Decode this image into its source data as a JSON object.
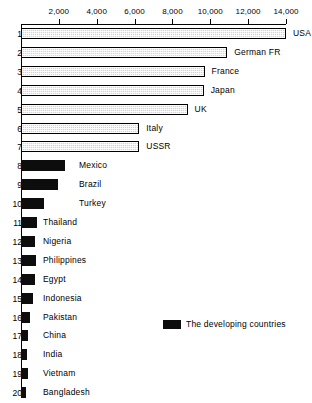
{
  "chart_data": {
    "type": "bar",
    "orientation": "horizontal",
    "title": "",
    "xlabel": "",
    "ylabel": "",
    "xlim": [
      0,
      14000
    ],
    "grid": false,
    "tick_labels": [
      "2,000",
      "4,000",
      "6,000",
      "8,000",
      "10,000",
      "12,000",
      "14,000"
    ],
    "tick_values": [
      2000,
      4000,
      6000,
      8000,
      10000,
      12000,
      14000
    ],
    "categories": [
      "USA",
      "German FR",
      "France",
      "Japan",
      "UK",
      "Italy",
      "USSR",
      "Mexico",
      "Brazil",
      "Turkey",
      "Thailand",
      "Nigeria",
      "Philippines",
      "Egypt",
      "Indonesia",
      "Pakistan",
      "China",
      "India",
      "Vietnam",
      "Bangladesh"
    ],
    "rank_numbers": [
      "1",
      "2",
      "3",
      "4",
      "5",
      "6",
      "7",
      "8",
      "9",
      "10",
      "11",
      "12",
      "13",
      "14",
      "15",
      "16",
      "17",
      "18",
      "19",
      "20"
    ],
    "values": [
      14000,
      10900,
      9700,
      9650,
      8800,
      6250,
      6250,
      2350,
      1950,
      1200,
      820,
      760,
      790,
      740,
      640,
      460,
      360,
      330,
      380,
      260
    ],
    "series": [
      {
        "name": "The developed countries",
        "style": "hatched",
        "color": "#d4d4d4",
        "members": [
          "USA",
          "German FR",
          "France",
          "Japan",
          "UK",
          "Italy",
          "USSR"
        ]
      },
      {
        "name": "The developing countries",
        "style": "solid",
        "color": "#0d0d0d",
        "members": [
          "Mexico",
          "Brazil",
          "Turkey",
          "Thailand",
          "Nigeria",
          "Philippines",
          "Egypt",
          "Indonesia",
          "Pakistan",
          "China",
          "India",
          "Vietnam",
          "Bangladesh"
        ]
      }
    ],
    "legend": {
      "position": "middle-right",
      "entries": [
        {
          "label": "The developing countries",
          "color": "#0d0d0d"
        }
      ]
    }
  },
  "rows": [
    {
      "num": "1",
      "label": "USA",
      "value": 14000,
      "type": "developed"
    },
    {
      "num": "2",
      "label": "German FR",
      "value": 10900,
      "type": "developed"
    },
    {
      "num": "3",
      "label": "France",
      "value": 9700,
      "type": "developed"
    },
    {
      "num": "4",
      "label": "Japan",
      "value": 9650,
      "type": "developed"
    },
    {
      "num": "5",
      "label": "UK",
      "value": 8800,
      "type": "developed"
    },
    {
      "num": "6",
      "label": "Italy",
      "value": 6250,
      "type": "developed"
    },
    {
      "num": "7",
      "label": "USSR",
      "value": 6250,
      "type": "developed"
    },
    {
      "num": "8",
      "label": "Mexico",
      "value": 2350,
      "type": "developing"
    },
    {
      "num": "9",
      "label": "Brazil",
      "value": 1950,
      "type": "developing"
    },
    {
      "num": "10",
      "label": "Turkey",
      "value": 1200,
      "type": "developing"
    },
    {
      "num": "11",
      "label": "Thailand",
      "value": 820,
      "type": "developing"
    },
    {
      "num": "12",
      "label": "Nigeria",
      "value": 760,
      "type": "developing"
    },
    {
      "num": "13",
      "label": "Philippines",
      "value": 790,
      "type": "developing"
    },
    {
      "num": "14",
      "label": "Egypt",
      "value": 740,
      "type": "developing"
    },
    {
      "num": "15",
      "label": "Indonesia",
      "value": 640,
      "type": "developing"
    },
    {
      "num": "16",
      "label": "Pakistan",
      "value": 460,
      "type": "developing"
    },
    {
      "num": "17",
      "label": "China",
      "value": 360,
      "type": "developing"
    },
    {
      "num": "18",
      "label": "India",
      "value": 330,
      "type": "developing"
    },
    {
      "num": "19",
      "label": "Vietnam",
      "value": 380,
      "type": "developing"
    },
    {
      "num": "20",
      "label": "Bangladesh",
      "value": 260,
      "type": "developing"
    }
  ],
  "axis": {
    "ticks": [
      "2,000",
      "4,000",
      "6,000",
      "8,000",
      "10,000",
      "12,000",
      "14,000"
    ]
  },
  "legend": {
    "label": "The developing countries"
  }
}
